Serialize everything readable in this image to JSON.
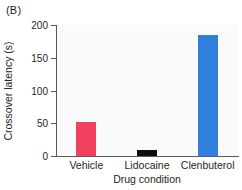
{
  "figure": {
    "panel_label": "(B)",
    "background_color": "#ffffff",
    "plot_background_color": "#fafafa",
    "axis_color": "#58595b",
    "text_color": "#231f20"
  },
  "chart_data": {
    "type": "bar",
    "title": "",
    "subtitle": "",
    "panel_label": "(B)",
    "categories": [
      "Vehicle",
      "Lidocaine",
      "Clenbuterol"
    ],
    "values": [
      52,
      9,
      185
    ],
    "bar_colors": [
      "#f0425e",
      "#0d0d0d",
      "#2f7fdc"
    ],
    "xlabel": "Drug condition",
    "ylabel": "Crossover latency (s)",
    "ylim": [
      0,
      200
    ],
    "yticks": [
      0,
      50,
      100,
      150,
      200
    ],
    "ytick_labels": [
      "0",
      "50",
      "100",
      "150",
      "200"
    ],
    "grid": false,
    "legend": false,
    "legend_position": "none",
    "annotations": []
  },
  "axes": {
    "y": {
      "label": "Crossover latency (s)",
      "ticks": [
        {
          "value": 200,
          "label": "200"
        },
        {
          "value": 150,
          "label": "150"
        },
        {
          "value": 100,
          "label": "100"
        },
        {
          "value": 50,
          "label": "50"
        },
        {
          "value": 0,
          "label": "0"
        }
      ]
    },
    "x": {
      "label": "Drug condition",
      "ticks": [
        {
          "label": "Vehicle"
        },
        {
          "label": "Lidocaine"
        },
        {
          "label": "Clenbuterol"
        }
      ]
    }
  }
}
